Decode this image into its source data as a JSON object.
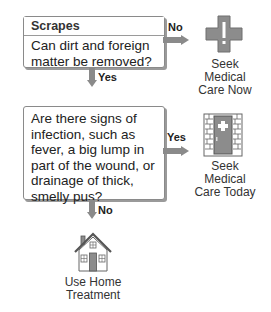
{
  "flowchart": {
    "step1": {
      "title": "Scrapes",
      "question": "Can dirt and foreign matter be removed?",
      "no_label": "No",
      "yes_label": "Yes"
    },
    "step2": {
      "question": "Are there signs of infection, such as fever, a big lump in part of the wound, or drainage of thick, smelly pus?",
      "yes_label": "Yes",
      "no_label": "No"
    },
    "outcomes": {
      "care_now": {
        "line1": "Seek Medical",
        "line2": "Care Now",
        "icon": "medical-cross-exclamation-icon"
      },
      "care_today": {
        "line1": "Seek Medical",
        "line2": "Care Today",
        "icon": "clinic-door-icon"
      },
      "home": {
        "line1": "Use Home",
        "line2": "Treatment",
        "icon": "house-icon"
      }
    },
    "colors": {
      "icon_gray": "#8c8c8c",
      "arrow_gray": "#8a8a8a",
      "border": "#8a8a8a"
    }
  }
}
